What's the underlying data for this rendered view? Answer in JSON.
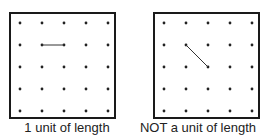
{
  "figures": [
    {
      "id": "left",
      "caption": "1 unit of length",
      "grid": {
        "rows": 5,
        "cols": 5
      },
      "segment": {
        "from": [
          1,
          1
        ],
        "to": [
          2,
          1
        ],
        "style": "horizontal"
      }
    },
    {
      "id": "right",
      "caption": "NOT a unit of length",
      "grid": {
        "rows": 5,
        "cols": 5
      },
      "segment": {
        "from": [
          1,
          1
        ],
        "to": [
          2,
          2
        ],
        "style": "diagonal"
      }
    }
  ],
  "colors": {
    "border": "#1a1a1a",
    "dot": "#222222",
    "segment": "#333333",
    "text": "#222222"
  }
}
